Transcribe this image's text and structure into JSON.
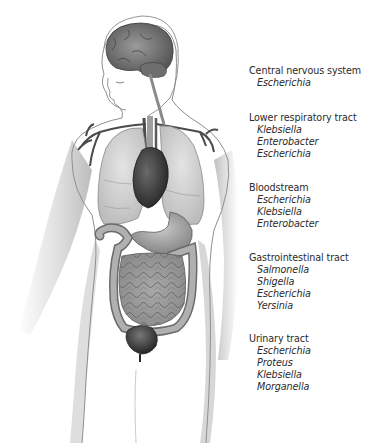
{
  "sites": [
    {
      "title": "Central nervous system",
      "organisms": [
        "Escherichia"
      ]
    },
    {
      "title": "Lower respiratory tract",
      "organisms": [
        "Klebsiella",
        "Enterobacter",
        "Escherichia"
      ]
    },
    {
      "title": "Bloodstream",
      "organisms": [
        "Escherichia",
        "Klebsiella",
        "Enterobacter"
      ]
    },
    {
      "title": "Gastrointestinal tract",
      "organisms": [
        "Salmonella",
        "Shigella",
        "Escherichia",
        "Yersinia"
      ]
    },
    {
      "title": "Urinary tract",
      "organisms": [
        "Escherichia",
        "Proteus",
        "Klebsiella",
        "Morganella"
      ]
    }
  ],
  "colors": {
    "background": "#ffffff",
    "text": "#2b2b2b",
    "body_outline": "#8a8a8a",
    "organ_dark": "#3a3a3a",
    "organ_mid": "#8c8c8c",
    "organ_light": "#cfcfcf"
  }
}
